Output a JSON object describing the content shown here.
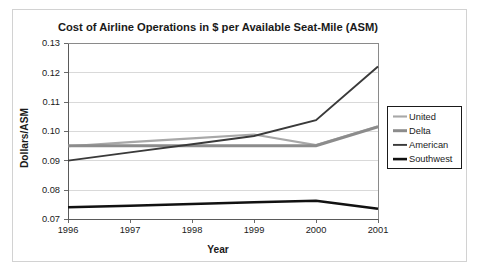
{
  "figure": {
    "border_color": "#d2d2d2",
    "background": "#ffffff"
  },
  "chart_data": {
    "type": "line",
    "title": "Cost of Airline Operations in $ per Available Seat-Mile (ASM)",
    "xlabel": "Year",
    "ylabel": "Dollars/ASM",
    "x": [
      1996,
      1997,
      1998,
      1999,
      2000,
      2001
    ],
    "xticklabels": [
      "1996",
      "1997",
      "1998",
      "1999",
      "2000",
      "2001"
    ],
    "xlim": [
      1996,
      2001
    ],
    "ylim": [
      0.07,
      0.13
    ],
    "yticks": [
      0.07,
      0.08,
      0.09,
      0.1,
      0.11,
      0.12,
      0.13
    ],
    "yticklabels": [
      "0.07",
      "0.08",
      "0.09",
      "0.10",
      "0.11",
      "0.12",
      "0.13"
    ],
    "grid": "horizontal",
    "legend_position": "right",
    "series": [
      {
        "name": "United",
        "color": "#a8a8a8",
        "width": 2.1,
        "values": [
          0.0948,
          0.0962,
          0.0975,
          0.0988,
          0.0952,
          0.1016
        ]
      },
      {
        "name": "Delta",
        "color": "#8c8c8c",
        "width": 3.0,
        "values": [
          0.095,
          0.095,
          0.095,
          0.095,
          0.095,
          0.1014
        ]
      },
      {
        "name": "American",
        "color": "#3a3a3a",
        "width": 1.9,
        "values": [
          0.0899,
          0.0927,
          0.0955,
          0.0983,
          0.1037,
          0.122
        ]
      },
      {
        "name": "Southwest",
        "color": "#111111",
        "width": 2.6,
        "values": [
          0.074,
          0.0745,
          0.0751,
          0.0757,
          0.0762,
          0.0735
        ]
      }
    ]
  },
  "legend": {
    "entries": [
      {
        "label": "United"
      },
      {
        "label": "Delta"
      },
      {
        "label": "American"
      },
      {
        "label": "Southwest"
      }
    ]
  }
}
